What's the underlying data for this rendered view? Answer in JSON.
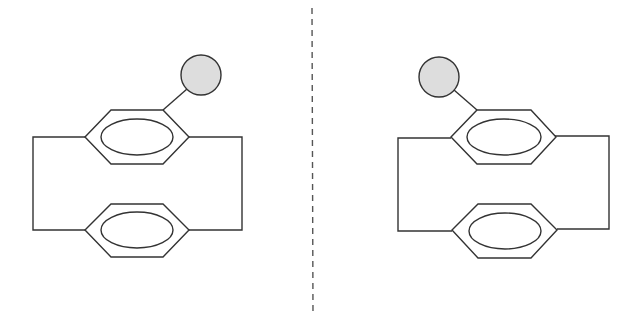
{
  "diagram": {
    "type": "planar-chiral-enantiomers",
    "description": "Two mirror-image substituted [2.2]paracyclophane structures separated by a dashed mirror plane",
    "colors": {
      "line": "#333333",
      "substituent_fill": "#dddddd",
      "mirror_line": "#555555",
      "background": "#ffffff"
    },
    "mirror_plane": {
      "x": 312,
      "y1": 8,
      "y2": 316,
      "style": "dashed"
    },
    "molecules": [
      {
        "id": "left-enantiomer",
        "substituent_position": "upper-right",
        "upper_ring": {
          "cx": 137,
          "cy": 137
        },
        "lower_ring": {
          "cx": 137,
          "cy": 230
        },
        "bridge": {
          "left_x": 33,
          "right_x": 242
        },
        "substituent": {
          "cx": 201,
          "cy": 75,
          "r": 20
        }
      },
      {
        "id": "right-enantiomer",
        "substituent_position": "upper-left",
        "upper_ring": {
          "cx": 504,
          "cy": 137
        },
        "lower_ring": {
          "cx": 504,
          "cy": 230
        },
        "bridge": {
          "left_x": 398,
          "right_x": 609
        },
        "substituent": {
          "cx": 439,
          "cy": 77,
          "r": 20
        }
      }
    ]
  }
}
